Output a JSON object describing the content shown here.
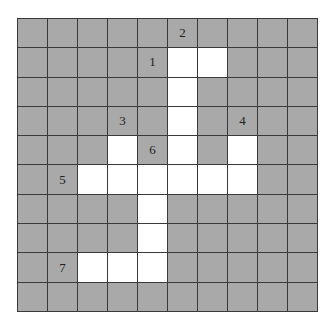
{
  "puzzle": {
    "rows": 10,
    "cols": 10,
    "colors": {
      "filled": "#a9a9a9",
      "open": "#ffffff",
      "line": "#3a3a3a"
    },
    "white_cells": [
      [
        1,
        5
      ],
      [
        1,
        6
      ],
      [
        2,
        5
      ],
      [
        3,
        5
      ],
      [
        4,
        3
      ],
      [
        4,
        5
      ],
      [
        4,
        7
      ],
      [
        5,
        2
      ],
      [
        5,
        3
      ],
      [
        5,
        4
      ],
      [
        5,
        5
      ],
      [
        5,
        6
      ],
      [
        5,
        7
      ],
      [
        6,
        4
      ],
      [
        7,
        4
      ],
      [
        8,
        2
      ],
      [
        8,
        3
      ],
      [
        8,
        4
      ]
    ],
    "labels": [
      {
        "row": 0,
        "col": 5,
        "text": "2"
      },
      {
        "row": 1,
        "col": 4,
        "text": "1"
      },
      {
        "row": 3,
        "col": 3,
        "text": "3"
      },
      {
        "row": 3,
        "col": 7,
        "text": "4"
      },
      {
        "row": 4,
        "col": 4,
        "text": "6"
      },
      {
        "row": 5,
        "col": 1,
        "text": "5"
      },
      {
        "row": 8,
        "col": 1,
        "text": "7"
      }
    ]
  }
}
